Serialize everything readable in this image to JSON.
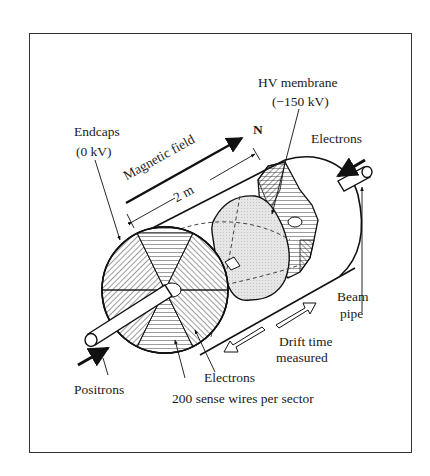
{
  "figure": {
    "labels": {
      "hv_membrane": "HV membrane",
      "hv_voltage": "(−150 kV)",
      "endcaps": "Endcaps",
      "endcaps_voltage": "(0 kV)",
      "magnetic_field": "Magnetic field",
      "north": "N",
      "length": "2 m",
      "electrons_top": "Electrons",
      "beam_pipe_line1": "Beam",
      "beam_pipe_line2": "pipe",
      "drift_line1": "Drift time",
      "drift_line2": "measured",
      "electrons_bottom": "Electrons",
      "sense_wires": "200 sense wires per sector",
      "positrons": "Positrons"
    },
    "colors": {
      "ink": "#1a1a1a",
      "membrane_fill": "#e4e4e4",
      "background": "#ffffff"
    }
  }
}
